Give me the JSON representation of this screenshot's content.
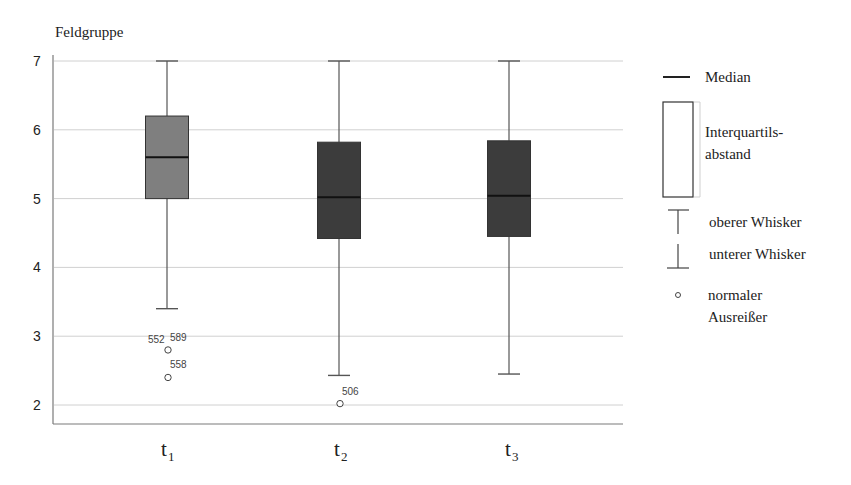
{
  "chart_data": {
    "type": "boxplot",
    "title": "",
    "ylabel": "Feldgruppe",
    "xlabel": "",
    "ylim": [
      1.7,
      7.0
    ],
    "yticks": [
      2,
      3,
      4,
      5,
      6,
      7
    ],
    "grid": true,
    "legend_position": "right",
    "categories": [
      {
        "label": "t",
        "subscript": "1"
      },
      {
        "label": "t",
        "subscript": "2"
      },
      {
        "label": "t",
        "subscript": "3"
      }
    ],
    "series": [
      {
        "name": "t1",
        "whisker_low": 3.4,
        "q1": 5.0,
        "median": 5.6,
        "q3": 6.2,
        "whisker_high": 7.0,
        "fill": "#7f7f7f",
        "outliers": [
          {
            "value": 2.8,
            "labels": [
              "552",
              "589"
            ]
          },
          {
            "value": 2.4,
            "labels": [
              "558"
            ]
          }
        ]
      },
      {
        "name": "t2",
        "whisker_low": 2.43,
        "q1": 4.42,
        "median": 5.02,
        "q3": 5.82,
        "whisker_high": 7.0,
        "fill": "#3c3c3c",
        "outliers": [
          {
            "value": 2.02,
            "labels": [
              "506"
            ]
          }
        ]
      },
      {
        "name": "t3",
        "whisker_low": 2.45,
        "q1": 4.45,
        "median": 5.04,
        "q3": 5.84,
        "whisker_high": 7.0,
        "fill": "#3c3c3c",
        "outliers": []
      }
    ],
    "legend": [
      {
        "symbol": "median-line",
        "label": "Median"
      },
      {
        "symbol": "iqr-box",
        "label_lines": [
          "Interquartils-",
          "abstand"
        ]
      },
      {
        "symbol": "upper-whisker",
        "label": "oberer Whisker"
      },
      {
        "symbol": "lower-whisker",
        "label": "unterer Whisker"
      },
      {
        "symbol": "outlier-circle",
        "label_lines": [
          "normaler",
          "Ausreißer"
        ]
      }
    ]
  },
  "colors": {
    "axis": "#7a7a7a",
    "grid": "#d0d0d0",
    "box_t1": "#7f7f7f",
    "box_t2": "#3c3c3c",
    "box_t3": "#3c3c3c",
    "median": "#111111"
  }
}
